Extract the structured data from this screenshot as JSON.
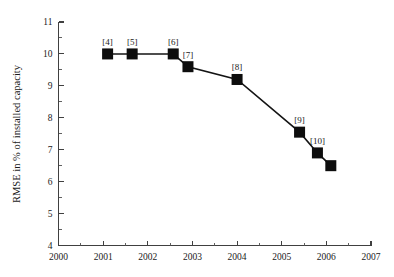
{
  "chart_data": {
    "type": "line",
    "title": "",
    "xlabel": "",
    "ylabel": "RMSE in % of installed capacity",
    "xlim": [
      2000,
      2007
    ],
    "ylim": [
      4,
      11
    ],
    "grid": false,
    "legend": null,
    "x_ticks": [
      "2000",
      "2001",
      "2002",
      "2003",
      "2004",
      "2005",
      "2006",
      "2007"
    ],
    "x_tick_values": [
      2000,
      2001,
      2002,
      2003,
      2004,
      2005,
      2006,
      2007
    ],
    "y_ticks": [
      "4",
      "5",
      "6",
      "7",
      "8",
      "9",
      "10",
      "11"
    ],
    "y_tick_values": [
      4,
      5,
      6,
      7,
      8,
      9,
      10,
      11
    ],
    "x_minor_step": 0.5,
    "y_minor_step": 0.5,
    "marker": "square",
    "marker_color": "#0d0d0d",
    "line_color": "#141414",
    "series": [
      {
        "name": "RMSE",
        "points": [
          {
            "x": 2001.1,
            "y": 10.0,
            "label": "[4]"
          },
          {
            "x": 2001.65,
            "y": 10.0,
            "label": "[5]"
          },
          {
            "x": 2002.57,
            "y": 10.0,
            "label": "[6]"
          },
          {
            "x": 2002.9,
            "y": 9.6,
            "label": "[7]"
          },
          {
            "x": 2004.0,
            "y": 9.2,
            "label": "[8]"
          },
          {
            "x": 2005.4,
            "y": 7.55,
            "label": "[9]"
          },
          {
            "x": 2005.8,
            "y": 6.9,
            "label": "[10]"
          },
          {
            "x": 2006.1,
            "y": 6.5,
            "label": ""
          }
        ]
      }
    ]
  }
}
